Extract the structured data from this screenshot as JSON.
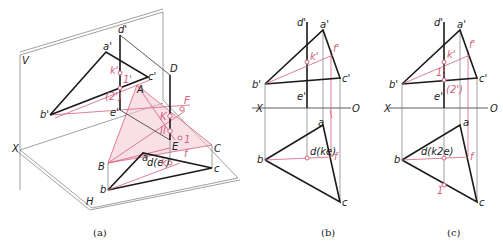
{
  "figure": {
    "colors": {
      "line": "#1a1a1a",
      "accent": "#d4607a",
      "plane_fill": "#f3c7d2"
    },
    "panels": [
      {
        "id": "a",
        "caption": "(a)",
        "labels": {
          "V": "V",
          "H": "H",
          "X": "X",
          "a_p": "a'",
          "b_p": "b'",
          "c_p": "c'",
          "d_p": "d'",
          "e_p": "e'",
          "k_p": "k'",
          "one_p": "1'",
          "two_p": "(2')",
          "A": "A",
          "B": "B",
          "C": "C",
          "D": "D",
          "E": "E",
          "F": "F",
          "K": "K",
          "II": "II",
          "a": "a",
          "b": "b",
          "c": "c",
          "de": "d(e",
          "k": "k",
          ")": ")",
          "one": "1",
          "f": "f"
        }
      },
      {
        "id": "b",
        "caption": "(b)",
        "labels": {
          "X": "X",
          "O": "O",
          "a_p": "a'",
          "b_p": "b'",
          "c_p": "c'",
          "d_p": "d'",
          "e_p": "e'",
          "k_p": "k'",
          "f_p": "f'",
          "a": "a",
          "b": "b",
          "c": "c",
          "dke": "d(ke)",
          "f": "f"
        }
      },
      {
        "id": "c",
        "caption": "(c)",
        "labels": {
          "X": "X",
          "O": "O",
          "a_p": "a'",
          "b_p": "b'",
          "c_p": "c'",
          "d_p": "d'",
          "e_p": "e'",
          "k_p": "k'",
          "one_p": "1'",
          "two_p": "(2')",
          "f_p": "f'",
          "a": "a",
          "b": "b",
          "c": "c",
          "dk2e": "d(k2e)",
          "f": "f",
          "one": "1"
        }
      }
    ]
  }
}
